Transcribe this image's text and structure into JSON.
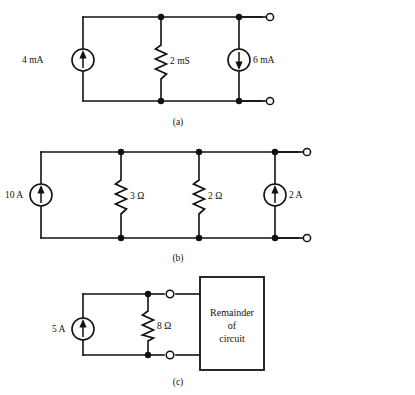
{
  "figure": {
    "background_color": "#ffffff",
    "line_color": "#111111"
  },
  "panels": [
    {
      "id": "panel-a",
      "caption": "(a)",
      "components": [
        {
          "name": "current-source-4ma",
          "label": "4 mA",
          "type": "current-source",
          "arrow": "up",
          "value": "4",
          "unit": "mA"
        },
        {
          "name": "conductance-2ms",
          "label": "2 mS",
          "type": "resistor",
          "value": "2",
          "unit": "mS"
        },
        {
          "name": "current-source-6ma",
          "label": "6 mA",
          "type": "current-source",
          "arrow": "down",
          "value": "6",
          "unit": "mA"
        }
      ],
      "terminals": [
        "open-terminal-top",
        "open-terminal-bottom"
      ]
    },
    {
      "id": "panel-b",
      "caption": "(b)",
      "components": [
        {
          "name": "current-source-10a",
          "label": "10 A",
          "type": "current-source",
          "arrow": "up",
          "value": "10",
          "unit": "A"
        },
        {
          "name": "resistor-3ohm",
          "label": "3 Ω",
          "type": "resistor",
          "value": "3",
          "unit": "Ω"
        },
        {
          "name": "resistor-2ohm",
          "label": "2 Ω",
          "type": "resistor",
          "value": "2",
          "unit": "Ω"
        },
        {
          "name": "current-source-2a",
          "label": "2 A",
          "type": "current-source",
          "arrow": "up",
          "value": "2",
          "unit": "A"
        }
      ],
      "terminals": [
        "open-terminal-top",
        "open-terminal-bottom"
      ]
    },
    {
      "id": "panel-c",
      "caption": "(c)",
      "components": [
        {
          "name": "current-source-5a",
          "label": "5 A",
          "type": "current-source",
          "arrow": "up",
          "value": "5",
          "unit": "A"
        },
        {
          "name": "resistor-8ohm",
          "label": "8 Ω",
          "type": "resistor",
          "value": "8",
          "unit": "Ω"
        }
      ],
      "block": {
        "name": "remainder-of-circuit-box",
        "line1": "Remainder",
        "line2": "of",
        "line3": "circuit"
      },
      "terminals": [
        "open-terminal-top",
        "open-terminal-bottom"
      ]
    }
  ]
}
